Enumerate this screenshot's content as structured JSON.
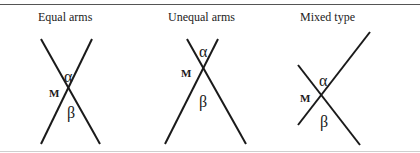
{
  "panels": [
    {
      "title": "Equal arms",
      "vertex_label": "M",
      "upper_angle": "α",
      "lower_angle": "β",
      "lines": [
        {
          "x1": 41,
          "y1": 39,
          "x2": 100,
          "y2": 144
        },
        {
          "x1": 92,
          "y1": 39,
          "x2": 41,
          "y2": 144
        }
      ]
    },
    {
      "title": "Unequal arms",
      "vertex_label": "M",
      "upper_angle": "α",
      "lower_angle": "β",
      "lines": [
        {
          "x1": 187,
          "y1": 39,
          "x2": 246,
          "y2": 144
        },
        {
          "x1": 218,
          "y1": 39,
          "x2": 165,
          "y2": 144
        }
      ]
    },
    {
      "title": "Mixed type",
      "vertex_label": "M",
      "upper_angle": "α",
      "lower_angle": "β",
      "lines": [
        {
          "x1": 298,
          "y1": 65,
          "x2": 360,
          "y2": 145
        },
        {
          "x1": 370,
          "y1": 32,
          "x2": 298,
          "y2": 125
        }
      ]
    }
  ],
  "colors": {
    "line": "#1a1a1a",
    "rule_top": "#555555",
    "rule_bottom": "#cfcfcf"
  }
}
